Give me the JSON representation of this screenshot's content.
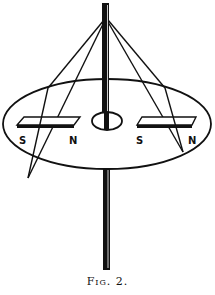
{
  "figure": {
    "caption": "Fig. 2.",
    "ink_color": "#111111",
    "background": "#ffffff",
    "magnets": [
      {
        "name": "left-magnet",
        "south_label": "S",
        "north_label": "N"
      },
      {
        "name": "right-magnet",
        "south_label": "S",
        "north_label": "N"
      }
    ],
    "parts": [
      "vertical-rod",
      "suspension-strings",
      "elliptical-disk",
      "central-hole",
      "bar-magnets"
    ]
  }
}
